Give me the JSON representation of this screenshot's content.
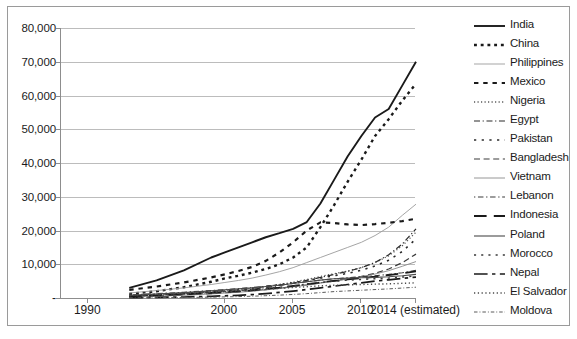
{
  "chart_data": {
    "type": "line",
    "title": "",
    "subtitle": "",
    "xlabel": "",
    "ylabel": "",
    "grid": true,
    "legend_position": "right",
    "xlim": [
      1988,
      2014
    ],
    "ylim": [
      0,
      80000
    ],
    "x_tick_labels": [
      "1990",
      "2000",
      "2005",
      "2010",
      "2014 (estimated)"
    ],
    "x_tick_values": [
      1990,
      2000,
      2005,
      2010,
      2014
    ],
    "y_tick_labels": [
      "80,000",
      "70,000",
      "60,000",
      "50,000",
      "40,000",
      "30,000",
      "20,000",
      "10,000",
      "-"
    ],
    "y_tick_values": [
      80000,
      70000,
      60000,
      50000,
      40000,
      30000,
      20000,
      10000,
      0
    ],
    "x": [
      1993,
      1995,
      1997,
      1999,
      2000,
      2001,
      2002,
      2003,
      2004,
      2005,
      2006,
      2007,
      2008,
      2009,
      2010,
      2011,
      2012,
      2013,
      2014
    ],
    "series": [
      {
        "name": "India",
        "style": "solid",
        "width": 1.9,
        "color": "#1a1a1a",
        "values": [
          3000,
          5200,
          8200,
          12000,
          13500,
          15000,
          16500,
          18000,
          19200,
          20500,
          22500,
          28000,
          35000,
          42000,
          48000,
          53500,
          56000,
          63000,
          70000
        ]
      },
      {
        "name": "China",
        "style": "dotted",
        "width": 2.4,
        "color": "#1a1a1a",
        "values": [
          1200,
          2000,
          3200,
          4800,
          5800,
          6600,
          7500,
          8600,
          10000,
          12000,
          15000,
          21000,
          27500,
          34500,
          41000,
          48000,
          53000,
          58500,
          63500
        ]
      },
      {
        "name": "Philippines",
        "style": "solid",
        "width": 0.9,
        "color": "#9b9b9b",
        "values": [
          1500,
          2200,
          3000,
          4000,
          4600,
          5200,
          5900,
          6800,
          7800,
          9000,
          10500,
          12000,
          13500,
          15000,
          16500,
          18500,
          21000,
          24500,
          27800
        ]
      },
      {
        "name": "Mexico",
        "style": "dotted-coarse",
        "width": 2.2,
        "color": "#1a1a1a",
        "values": [
          2400,
          3400,
          4600,
          6100,
          7000,
          8000,
          9200,
          11000,
          13500,
          16500,
          20000,
          22400,
          22200,
          21800,
          21600,
          21900,
          22300,
          22800,
          23500
        ]
      },
      {
        "name": "Nigeria",
        "style": "dotted-fine",
        "width": 1.3,
        "color": "#555555",
        "values": [
          600,
          900,
          1300,
          1800,
          2100,
          2500,
          2900,
          3400,
          4000,
          4700,
          5500,
          6400,
          7200,
          8000,
          9000,
          10500,
          12500,
          15500,
          19500
        ]
      },
      {
        "name": "Egypt",
        "style": "dash-dot",
        "width": 1.2,
        "color": "#2b2b2b",
        "values": [
          500,
          800,
          1150,
          1600,
          1900,
          2200,
          2600,
          3100,
          3700,
          4400,
          5200,
          6100,
          7000,
          7900,
          9000,
          10500,
          12800,
          16000,
          20500
        ]
      },
      {
        "name": "Pakistan",
        "style": "dotted-sparse",
        "width": 1.6,
        "color": "#2b2b2b",
        "values": [
          700,
          1000,
          1400,
          1900,
          2200,
          2500,
          2900,
          3400,
          3900,
          4500,
          5200,
          5900,
          6600,
          7300,
          8200,
          9500,
          11200,
          13800,
          17500
        ]
      },
      {
        "name": "Bangladesh",
        "style": "dashed-long",
        "width": 1.2,
        "color": "#3a3a3a",
        "values": [
          400,
          650,
          950,
          1300,
          1550,
          1800,
          2100,
          2500,
          2900,
          3400,
          3900,
          4500,
          5100,
          5700,
          6400,
          7300,
          8600,
          10500,
          13000
        ]
      },
      {
        "name": "Vietnam",
        "style": "solid",
        "width": 0.9,
        "color": "#8a8a8a",
        "values": [
          300,
          500,
          800,
          1200,
          1450,
          1700,
          2000,
          2400,
          2800,
          3300,
          3800,
          4400,
          5000,
          5600,
          6300,
          7100,
          8100,
          9400,
          10800
        ]
      },
      {
        "name": "Lebanon",
        "style": "dash-dot-sparse",
        "width": 1.1,
        "color": "#3a3a3a",
        "values": [
          900,
          1300,
          1700,
          2200,
          2500,
          2800,
          3100,
          3500,
          3900,
          4300,
          4800,
          5300,
          5700,
          6000,
          6300,
          6600,
          7000,
          7500,
          8200
        ]
      },
      {
        "name": "Indonesia",
        "style": "dashed-em",
        "width": 1.8,
        "color": "#1a1a1a",
        "values": [
          500,
          800,
          1100,
          1500,
          1750,
          2000,
          2300,
          2700,
          3100,
          3600,
          4100,
          4600,
          5100,
          5500,
          5900,
          6300,
          6800,
          7300,
          7900
        ]
      },
      {
        "name": "Poland",
        "style": "solid",
        "width": 1.1,
        "color": "#4a4a4a",
        "values": [
          800,
          1200,
          1600,
          2100,
          2400,
          2700,
          3000,
          3400,
          3800,
          4300,
          4800,
          5300,
          5700,
          5900,
          6000,
          6100,
          6300,
          6600,
          7000
        ]
      },
      {
        "name": "Morocco",
        "style": "dotted-sparse",
        "width": 1.5,
        "color": "#3a3a3a",
        "values": [
          600,
          900,
          1250,
          1650,
          1900,
          2150,
          2450,
          2800,
          3200,
          3600,
          4100,
          4600,
          5000,
          5300,
          5500,
          5700,
          5900,
          6200,
          6600
        ]
      },
      {
        "name": "Nepal",
        "style": "dash-dot-long",
        "width": 1.7,
        "color": "#1a1a1a",
        "values": [
          100,
          180,
          300,
          500,
          650,
          800,
          1000,
          1300,
          1650,
          2050,
          2500,
          3000,
          3500,
          4000,
          4500,
          5000,
          5400,
          5800,
          6200
        ]
      },
      {
        "name": "El Salvador",
        "style": "dotted-fine",
        "width": 1.4,
        "color": "#4a4a4a",
        "values": [
          800,
          1100,
          1400,
          1750,
          1950,
          2150,
          2350,
          2600,
          2850,
          3100,
          3350,
          3600,
          3800,
          3900,
          4000,
          4100,
          4200,
          4350,
          4500
        ]
      },
      {
        "name": "Moldova",
        "style": "dash-dot-fine",
        "width": 1.0,
        "color": "#5a5a5a",
        "values": [
          50,
          90,
          150,
          250,
          330,
          420,
          530,
          680,
          850,
          1050,
          1300,
          1600,
          1900,
          2100,
          2300,
          2500,
          2700,
          2950,
          3200
        ]
      }
    ]
  },
  "legend": {
    "items": [
      {
        "label": "India"
      },
      {
        "label": "China"
      },
      {
        "label": "Philippines"
      },
      {
        "label": "Mexico"
      },
      {
        "label": "Nigeria"
      },
      {
        "label": "Egypt"
      },
      {
        "label": "Pakistan"
      },
      {
        "label": "Bangladesh"
      },
      {
        "label": "Vietnam"
      },
      {
        "label": "Lebanon"
      },
      {
        "label": "Indonesia"
      },
      {
        "label": "Poland"
      },
      {
        "label": "Morocco"
      },
      {
        "label": "Nepal"
      },
      {
        "label": "El Salvador"
      },
      {
        "label": "Moldova"
      }
    ]
  },
  "colors": {
    "gridline": "#bcbcbc",
    "axis": "#8d8d8d",
    "text": "#1b1b1b",
    "frame": "#9a9a9a",
    "background": "#ffffff"
  }
}
